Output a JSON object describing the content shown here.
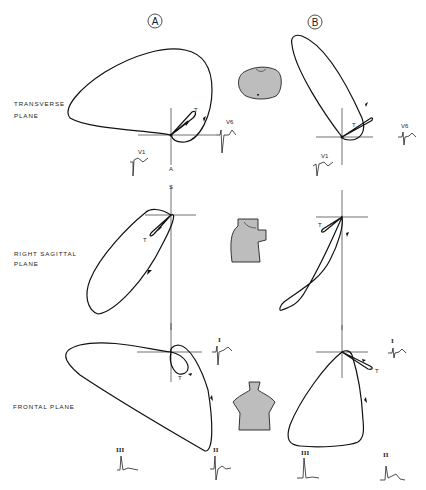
{
  "columns": [
    {
      "id": "A",
      "label": "A"
    },
    {
      "id": "B",
      "label": "B"
    }
  ],
  "rows": [
    {
      "id": "transverse",
      "label_line1": "TRANSVERSE",
      "label_line2": "PLANE"
    },
    {
      "id": "sagittal",
      "label_line1": "RIGHT  SAGITTAL",
      "label_line2": "PLANE"
    },
    {
      "id": "frontal",
      "label_line1": "FRONTAL  PLANE",
      "label_line2": ""
    }
  ],
  "annotations": {
    "t_label": "T",
    "axis_a": "A",
    "axis_s": "S"
  },
  "leads": {
    "transverse_a_v1": "V1",
    "transverse_a_v6": "V6",
    "transverse_b_v1": "V1",
    "transverse_b_v6": "V6",
    "frontal_a_i": "I",
    "frontal_a_iii": "III",
    "frontal_a_ii": "II",
    "frontal_b_i": "I",
    "frontal_b_iii": "III",
    "frontal_b_ii": "II"
  },
  "icons": {
    "transverse": "torso-cross-section-icon",
    "sagittal": "torso-side-view-icon",
    "frontal": "torso-front-view-icon"
  }
}
